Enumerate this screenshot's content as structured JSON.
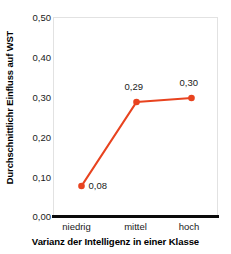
{
  "chart_data": {
    "type": "line",
    "title": "",
    "subtitle": "",
    "xlabel": "Varianz der Intelligenz in einer Klasse",
    "ylabel": "Durchschnittlichr Einfluss auf WST",
    "categories": [
      "niedrig",
      "mittel",
      "hoch"
    ],
    "values": [
      0.08,
      0.29,
      0.3
    ],
    "point_labels": [
      "0,08",
      "0,29",
      "0,30"
    ],
    "ylim": [
      0.0,
      0.5
    ],
    "ytick_values": [
      0.0,
      0.1,
      0.2,
      0.3,
      0.4,
      0.5
    ],
    "ytick_labels": [
      "0,00",
      "0,10",
      "0,20",
      "0,30",
      "0,40",
      "0,50"
    ],
    "grid": false,
    "legend": "none",
    "series_color": "#E8431F",
    "marker": "circle",
    "axis_color": "#0a0a0a",
    "frame_color": "#e2e2e2"
  }
}
